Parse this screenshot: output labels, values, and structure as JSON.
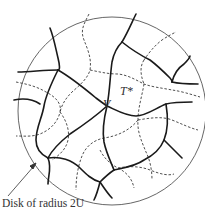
{
  "diagram": {
    "vertex_label": "V",
    "dual_tree_label": "T*",
    "disk_caption": "Disk of radius 2U",
    "colors": {
      "stroke": "#1a1a1a",
      "circle": "#555555",
      "text": "#333333"
    }
  }
}
